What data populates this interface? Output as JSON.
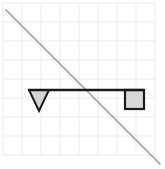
{
  "figure": {
    "width": 165,
    "height": 169,
    "background_color": "#ffffff"
  },
  "grid": {
    "name": "graph-paper-grid",
    "line_color": "#ece9f2",
    "line_width": 1,
    "cell_size": 19,
    "origin_x": 3,
    "origin_y": 3,
    "columns": 8,
    "rows": 8,
    "visible": true
  },
  "diagonal": {
    "name": "diagonal-line",
    "color": "#9a9a9a",
    "stroke_width": 1.6,
    "x1": 6,
    "y1": 10,
    "x2": 160,
    "y2": 164
  },
  "beam": {
    "name": "horizontal-beam",
    "color": "#1a1a1a",
    "stroke_width": 2.6,
    "x1": 28,
    "y1": 90,
    "x2": 144,
    "y2": 90
  },
  "fulcrum": {
    "name": "triangle-fulcrum",
    "shape": "inverted-triangle",
    "fill_color": "#d4d4d4",
    "stroke_color": "#1a1a1a",
    "stroke_width": 2,
    "points": "29,90 49,90 39,111",
    "apex_x": 39,
    "apex_y": 111,
    "base_left_x": 29,
    "base_right_x": 49,
    "base_y": 90
  },
  "block": {
    "name": "square-block",
    "shape": "square",
    "fill_color": "#d8d8d8",
    "stroke_color": "#1a1a1a",
    "stroke_width": 2.2,
    "x": 125,
    "y": 90,
    "width": 19,
    "height": 19
  }
}
